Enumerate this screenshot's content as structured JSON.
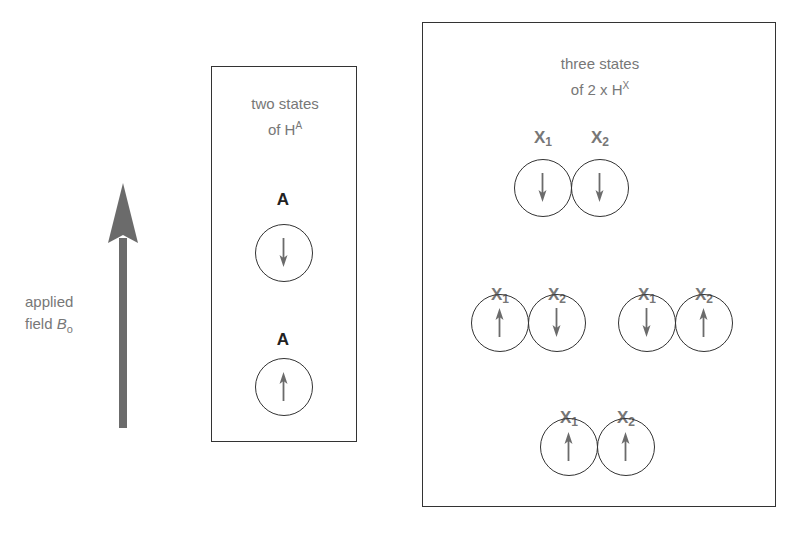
{
  "field": {
    "label_line1": "applied",
    "label_line2": "field ",
    "symbol": "B",
    "subscript": "o",
    "arrow_color": "#6b6b6b"
  },
  "panel_a": {
    "title_line1": "two states",
    "title_line2": "of H",
    "title_sup": "A",
    "states": [
      {
        "label": "A",
        "spin": "down"
      },
      {
        "label": "A",
        "spin": "up"
      }
    ]
  },
  "panel_x": {
    "title_line1": "three states",
    "title_line2": "of 2 x H",
    "title_sup": "X",
    "label_x1": "X",
    "label_x1_sub": "1",
    "label_x2": "X",
    "label_x2_sub": "2",
    "states": [
      {
        "x1": "down",
        "x2": "down"
      },
      {
        "x1": "up",
        "x2": "down"
      },
      {
        "x1": "down",
        "x2": "up"
      },
      {
        "x1": "up",
        "x2": "up"
      }
    ]
  },
  "colors": {
    "border": "#333333",
    "text_gray": "#777777",
    "arrow_gray": "#6b6b6b"
  }
}
